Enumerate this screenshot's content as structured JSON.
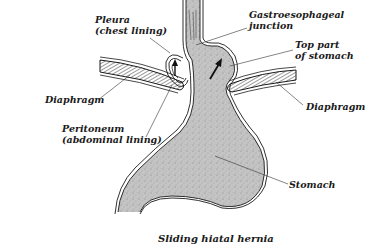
{
  "diagram": {
    "caption": "Sliding hiatal hernia",
    "colors": {
      "stomach_fill": "#bdbdbd",
      "outline": "#1a1a1a",
      "diaphragm_hatch": "#555555",
      "background": "#ffffff"
    },
    "labels": {
      "pleura": {
        "line1": "Pleura",
        "line2": "(chest lining)"
      },
      "ge_junction": {
        "line1": "Gastroesophageal",
        "line2": "junction"
      },
      "top_stomach": {
        "line1": "Top part",
        "line2": "of stomach"
      },
      "diaphragm_left": {
        "text": "Diaphragm"
      },
      "diaphragm_right": {
        "text": "Diaphragm"
      },
      "peritoneum": {
        "line1": "Peritoneum",
        "line2": "(abdominal lining)"
      },
      "stomach": {
        "text": "Stomach"
      }
    },
    "structures": [
      "esophagus",
      "pleura-fold",
      "diaphragm-left",
      "diaphragm-right",
      "stomach",
      "hernia-arrow-left",
      "hernia-arrow-right"
    ]
  }
}
